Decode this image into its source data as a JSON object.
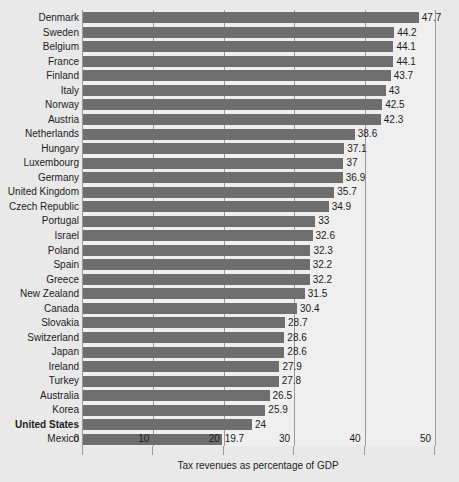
{
  "chart_data": {
    "type": "bar",
    "orientation": "horizontal",
    "title": "",
    "xlabel": "Tax revenues as percentage of GDP",
    "ylabel": "",
    "xlim": [
      0,
      50
    ],
    "xticks": [
      0,
      10,
      20,
      30,
      40,
      50
    ],
    "grid": true,
    "legend": null,
    "highlight_category": "United States",
    "bar_color": "#6e6e6e",
    "plot_background": "#efefef",
    "page_background": "#e9e9e9",
    "axis_color": "#9a9a9a",
    "categories": [
      "Denmark",
      "Sweden",
      "Belgium",
      "France",
      "Finland",
      "Italy",
      "Norway",
      "Austria",
      "Netherlands",
      "Hungary",
      "Luxembourg",
      "Germany",
      "United Kingdom",
      "Czech Republic",
      "Portugal",
      "Israel",
      "Poland",
      "Spain",
      "Greece",
      "New Zealand",
      "Canada",
      "Slovakia",
      "Switzerland",
      "Japan",
      "Ireland",
      "Turkey",
      "Australia",
      "Korea",
      "United States",
      "Mexico"
    ],
    "values": [
      47.7,
      44.2,
      44.1,
      44.1,
      43.7,
      43,
      42.5,
      42.3,
      38.6,
      37.1,
      37,
      36.9,
      35.7,
      34.9,
      33,
      32.6,
      32.3,
      32.2,
      32.2,
      31.5,
      30.4,
      28.7,
      28.6,
      28.6,
      27.9,
      27.8,
      26.5,
      25.9,
      24,
      19.7
    ],
    "value_labels": [
      "47.7",
      "44.2",
      "44.1",
      "44.1",
      "43.7",
      "43",
      "42.5",
      "42.3",
      "38.6",
      "37.1",
      "37",
      "36.9",
      "35.7",
      "34.9",
      "33",
      "32.6",
      "32.3",
      "32.2",
      "32.2",
      "31.5",
      "30.4",
      "28.7",
      "28.6",
      "28.6",
      "27.9",
      "27.8",
      "26.5",
      "25.9",
      "24",
      "19.7"
    ],
    "xtick_labels": [
      "0",
      "10",
      "20",
      "30",
      "40",
      "50"
    ]
  }
}
